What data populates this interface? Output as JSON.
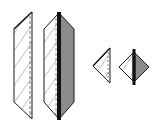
{
  "diagram": {
    "type": "prism-shapes",
    "shapes": [
      {
        "id": "large-half",
        "label": "large half prism",
        "hatched": true,
        "shaded_half": false
      },
      {
        "id": "large-full",
        "label": "large full prism",
        "hatched": true,
        "shaded_half": true
      },
      {
        "id": "small-half",
        "label": "small half prism",
        "hatched": true,
        "shaded_half": false
      },
      {
        "id": "small-full",
        "label": "small full prism",
        "hatched": true,
        "shaded_half": true
      }
    ],
    "colors": {
      "outline": "#1a1a1a",
      "hatch": "#c8c8c8",
      "shade": "#8c8c8c",
      "spine": "#111111",
      "background": "#ffffff"
    }
  }
}
